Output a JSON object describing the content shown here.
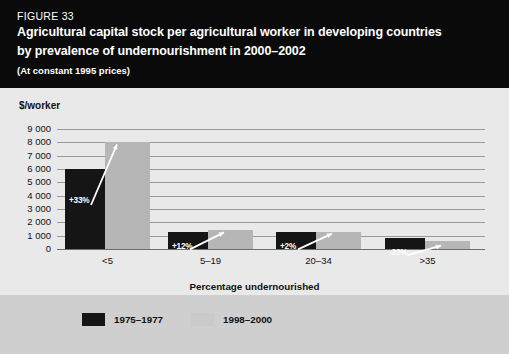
{
  "header": {
    "figure_label": "FIGURE 33",
    "title_line1": "Agricultural capital stock per agricultural worker in developing countries",
    "title_line2": "by prevalence of undernourishment in 2000–2002",
    "subtitle": "(At constant 1995 prices)"
  },
  "colors": {
    "header_bg": "#0a0a0a",
    "panel_bg": "#e9e9e9",
    "legend_bg": "#cfcfcf",
    "series_1975_1977": "#151515",
    "series_1998_2000": "#b6b6b6",
    "gridline": "#9a9a9a",
    "annotation_text": "#ffffff"
  },
  "legend": {
    "items": [
      {
        "label": "1975–1977",
        "swatch": "dark"
      },
      {
        "label": "1998–2000",
        "swatch": "light"
      }
    ]
  },
  "chart_data": {
    "type": "bar",
    "title": "Agricultural capital stock per agricultural worker in developing countries by prevalence of undernourishment in 2000–2002",
    "subtitle": "(At constant 1995 prices)",
    "xlabel": "Percentage undernourished",
    "ylabel": "$/worker",
    "ylim": [
      0,
      9000
    ],
    "yticks": [
      "0",
      "1 000",
      "2 000",
      "3 000",
      "4 000",
      "5 000",
      "6 000",
      "7 000",
      "8 000",
      "9 000"
    ],
    "ytick_values": [
      0,
      1000,
      2000,
      3000,
      4000,
      5000,
      6000,
      7000,
      8000,
      9000
    ],
    "grid": true,
    "legend_position": "bottom",
    "categories": [
      "<5",
      "5–19",
      "20–34",
      ">35"
    ],
    "series": [
      {
        "name": "1975–1977",
        "values": [
          6000,
          1250,
          1250,
          800
        ]
      },
      {
        "name": "1998–2000",
        "values": [
          8000,
          1400,
          1300,
          620
        ]
      }
    ],
    "annotations": [
      {
        "category": "<5",
        "label": "+33%",
        "direction": "up"
      },
      {
        "category": "5–19",
        "label": "+12%",
        "direction": "up"
      },
      {
        "category": "20–34",
        "label": "+2%",
        "direction": "up"
      },
      {
        "category": ">35",
        "label": "-22%",
        "direction": "down"
      }
    ]
  }
}
